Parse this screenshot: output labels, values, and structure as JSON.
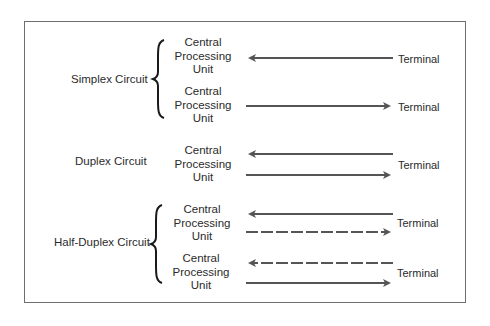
{
  "diagram": {
    "colors": {
      "line": "#555555",
      "text": "#2b2b2b",
      "frame": "#6e6e6e"
    },
    "groups": [
      {
        "label": "Simplex Circuit",
        "rows": [
          {
            "cpu": [
              "Central",
              "Processing",
              "Unit"
            ],
            "terminal": "Terminal",
            "arrows": [
              {
                "direction": "left",
                "style": "solid"
              }
            ]
          },
          {
            "cpu": [
              "Central",
              "Processing",
              "Unit"
            ],
            "terminal": "Terminal",
            "arrows": [
              {
                "direction": "right",
                "style": "solid"
              }
            ]
          }
        ]
      },
      {
        "label": "Duplex Circuit",
        "rows": [
          {
            "cpu": [
              "Central",
              "Processing",
              "Unit"
            ],
            "terminal": "Terminal",
            "arrows": [
              {
                "direction": "left",
                "style": "solid"
              },
              {
                "direction": "right",
                "style": "solid"
              }
            ]
          }
        ]
      },
      {
        "label": "Half-Duplex Circuit",
        "rows": [
          {
            "cpu": [
              "Central",
              "Processing",
              "Unit"
            ],
            "terminal": "Terminal",
            "arrows": [
              {
                "direction": "left",
                "style": "solid"
              },
              {
                "direction": "right",
                "style": "dashed"
              }
            ]
          },
          {
            "cpu": [
              "Central",
              "Processing",
              "Unit"
            ],
            "terminal": "Terminal",
            "arrows": [
              {
                "direction": "left",
                "style": "dashed"
              },
              {
                "direction": "right",
                "style": "solid"
              }
            ]
          }
        ]
      }
    ]
  }
}
